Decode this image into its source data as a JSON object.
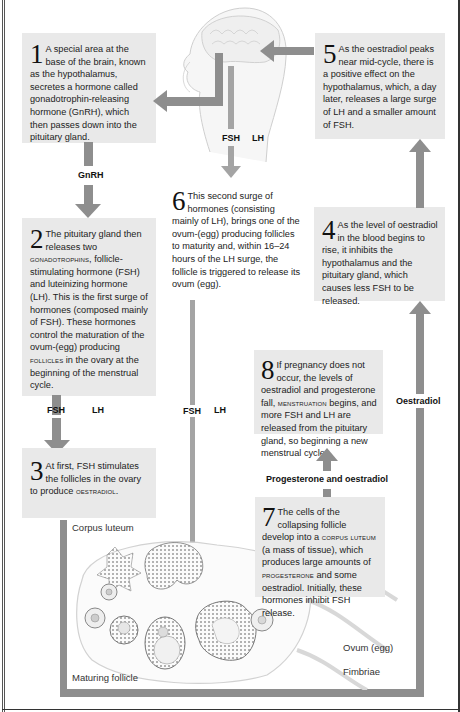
{
  "steps": {
    "s1": {
      "num": "1",
      "text": "A special area at the base of the brain, known as the hypothalamus, secretes a hormone called gonadotrophin-releasing hormone (GnRH), which then passes down into the pituitary gland."
    },
    "s2": {
      "num": "2",
      "text_a": "The pituitary gland then releases two ",
      "sc_a": "gonadotrophins",
      "text_b": ", follicle-stimulating hormone (FSH) and luteinizing hormone (LH). This is the first surge of hormones (composed mainly of FSH). These hormones control the maturation of the ovum-(egg) producing ",
      "sc_b": "follicles",
      "text_c": " in the ovary at the beginning of the menstrual cycle."
    },
    "s3": {
      "num": "3",
      "text_a": "At first, FSH stimulates the follicles in the ovary to produce ",
      "sc_a": "oestradiol",
      "text_b": "."
    },
    "s4": {
      "num": "4",
      "text": "As the level of oestradiol in the blood begins to rise, it inhibits the hypothalamus and the pituitary gland, which causes less FSH to be released."
    },
    "s5": {
      "num": "5",
      "text": "As the oestradiol peaks near mid-cycle, there is a positive effect on the hypothalamus, which, a day later, releases a large surge of LH and a smaller amount of FSH."
    },
    "s6": {
      "num": "6",
      "text": "This second surge of hormones (consisting mainly of LH), brings one of the ovum-(egg) producing follicles to maturity and, within 16–24 hours of the LH surge, the follicle is triggered to release its ovum (egg)."
    },
    "s7": {
      "num": "7",
      "text_a": "The cells of the collapsing follicle develop into a ",
      "sc_a": "corpus luteum",
      "text_b": " (a mass of tissue), which produces large amounts of ",
      "sc_b": "progesterone",
      "text_c": " and some oestradiol. Initially, these hormones inhibit FSH release."
    },
    "s8": {
      "num": "8",
      "text_a": "If pregnancy does not occur, the levels of oestradiol and progesterone fall, ",
      "sc_a": "menstruation",
      "text_b": " begins, and more FSH and LH are released from the pituitary gland, so beginning a new menstrual cycle."
    }
  },
  "labels": {
    "gnrh": "GnRH",
    "fsh_top": "FSH",
    "lh_top": "LH",
    "fsh_left": "FSH",
    "lh_left": "LH",
    "fsh_mid": "FSH",
    "lh_mid": "LH",
    "oestradiol": "Oestradiol",
    "prog_oest": "Progesterone and oestradiol"
  },
  "captions": {
    "corpus_luteum": "Corpus luteum",
    "maturing_follicle": "Maturing follicle",
    "ovum": "Ovum (egg)",
    "fimbriae": "Fimbriae"
  },
  "colors": {
    "arrow": "#8e8e8e",
    "box": "#e9e9e9"
  }
}
